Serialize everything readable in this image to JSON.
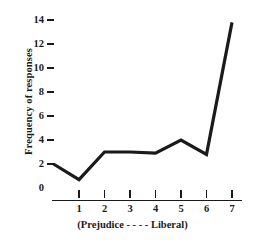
{
  "chart_data": {
    "type": "line",
    "title": "",
    "xlabel": "(Prejudice - - - - Liberal)",
    "ylabel": "Frequency of responses",
    "x": [
      0,
      1,
      2,
      3,
      4,
      5,
      6,
      7
    ],
    "values": [
      2,
      0.7,
      3,
      3,
      2.9,
      4,
      2.8,
      13.8
    ],
    "xtick_labels": [
      "1",
      "2",
      "3",
      "4",
      "5",
      "6",
      "7"
    ],
    "xtick_values": [
      1,
      2,
      3,
      4,
      5,
      6,
      7
    ],
    "ytick_labels": [
      "14",
      "12",
      "10",
      "8",
      "6",
      "4",
      "2"
    ],
    "ytick_values": [
      14,
      12,
      10,
      8,
      6,
      4,
      2
    ],
    "y_origin_label": "0",
    "xlim": [
      0,
      7.45
    ],
    "ylim": [
      0,
      14
    ],
    "grid": false,
    "legend": null,
    "line_color": "#1a1a1a",
    "background_color": "#ffffff"
  }
}
